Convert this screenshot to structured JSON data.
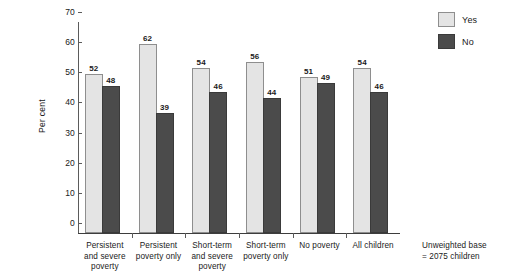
{
  "chart_data": {
    "type": "bar",
    "title": "",
    "xlabel": "",
    "ylabel": "Per cent",
    "ylim": [
      0,
      70
    ],
    "yticks": [
      0,
      10,
      20,
      30,
      40,
      50,
      60,
      70
    ],
    "grid": false,
    "legend_position": "top-right",
    "categories": [
      "Persistent and severe poverty",
      "Persistent poverty only",
      "Short-term and severe poverty",
      "Short-term poverty only",
      "No poverty",
      "All children"
    ],
    "category_lines": [
      [
        "Persistent",
        "and severe",
        "poverty"
      ],
      [
        "Persistent",
        "poverty only"
      ],
      [
        "Short-term",
        "and severe",
        "poverty"
      ],
      [
        "Short-term",
        "poverty only"
      ],
      [
        "No poverty"
      ],
      [
        "All children"
      ]
    ],
    "series": [
      {
        "name": "Yes",
        "values": [
          52,
          62,
          54,
          56,
          51,
          54
        ],
        "color": "#e4e4e4"
      },
      {
        "name": "No",
        "values": [
          48,
          39,
          46,
          44,
          49,
          46
        ],
        "color": "#4b4b4b"
      }
    ],
    "annotations": [
      "Unweighted base = 2075 children"
    ]
  },
  "legend": {
    "items": [
      {
        "label": "Yes"
      },
      {
        "label": "No"
      }
    ]
  },
  "footnote": {
    "line1": "Unweighted base",
    "line2": "= 2075 children"
  }
}
